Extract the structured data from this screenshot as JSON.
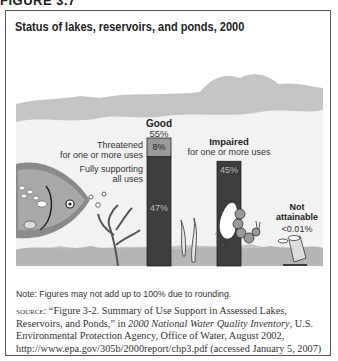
{
  "figure_label": "FIGURE 3.7",
  "chart_data": {
    "type": "bar",
    "title": "Status of lakes, reservoirs, and ponds, 2000",
    "categories": [
      "Good",
      "Impaired",
      "Not attainable"
    ],
    "series": [
      {
        "name": "Fully supporting all uses",
        "category": "Good",
        "value": 47,
        "label": "47%"
      },
      {
        "name": "Threatened for one or more uses",
        "category": "Good",
        "value": 8,
        "label": "8%"
      },
      {
        "name": "Impaired for one or more uses",
        "category": "Impaired",
        "value": 45,
        "label": "45%"
      },
      {
        "name": "Not attainable",
        "category": "Not attainable",
        "value": 0.01,
        "label": "<0.01%"
      }
    ],
    "annotations": {
      "good_title": "Good",
      "good_total": "55%",
      "threatened_label_1": "Threatened",
      "threatened_label_2": "for one or more uses",
      "fully_label_1": "Fully supporting",
      "fully_label_2": "all uses",
      "impaired_title": "Impaired",
      "impaired_sub": "for one or more uses",
      "na_title_1": "Not",
      "na_title_2": "attainable",
      "na_value": "<0.01%"
    },
    "ylim": [
      0,
      100
    ],
    "xlabel": "",
    "ylabel": "",
    "colors": {
      "fully": "#3d3d3d",
      "threatened": "#9a9a9a",
      "impaired": "#3d3d3d",
      "not_attainable": "#3d3d3d"
    }
  },
  "note": "Note: Figures may not add up to 100% due to rounding.",
  "source": {
    "label": "source:",
    "text_1": " “Figure 3-2. Summary of Use Support in Assessed Lakes, Reservoirs, and Ponds,” in ",
    "italic": "2000 National Water Quality Inventory",
    "text_2": ", U.S. Environmental Protection Agency, Office of Water, August 2002, http://www.epa.gov/305b/2000report/chp3.pdf (accessed January 5, 2007)"
  }
}
